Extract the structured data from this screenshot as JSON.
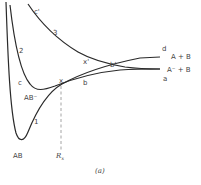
{
  "figure": {
    "caption": "(a)",
    "type": "potential energy curves",
    "stroke_color": "#2a2a2a",
    "label_color": "#444444"
  },
  "curves": [
    {
      "id": "1",
      "label": "1"
    },
    {
      "id": "2",
      "label": "2"
    },
    {
      "id": "3",
      "label": "3"
    }
  ],
  "points": {
    "c": "c",
    "c_prime": "c'",
    "x": "x",
    "x_prime": "x'",
    "b": "b",
    "b_prime": "b'",
    "a": "a",
    "d": "d"
  },
  "states": {
    "AB": "AB",
    "AB_minus": "AB⁻",
    "A_plus_B": "A + B",
    "A_minus_plus_B": "A⁻ + B"
  },
  "axis": {
    "rx_label": "R",
    "rx_sub": "x"
  }
}
